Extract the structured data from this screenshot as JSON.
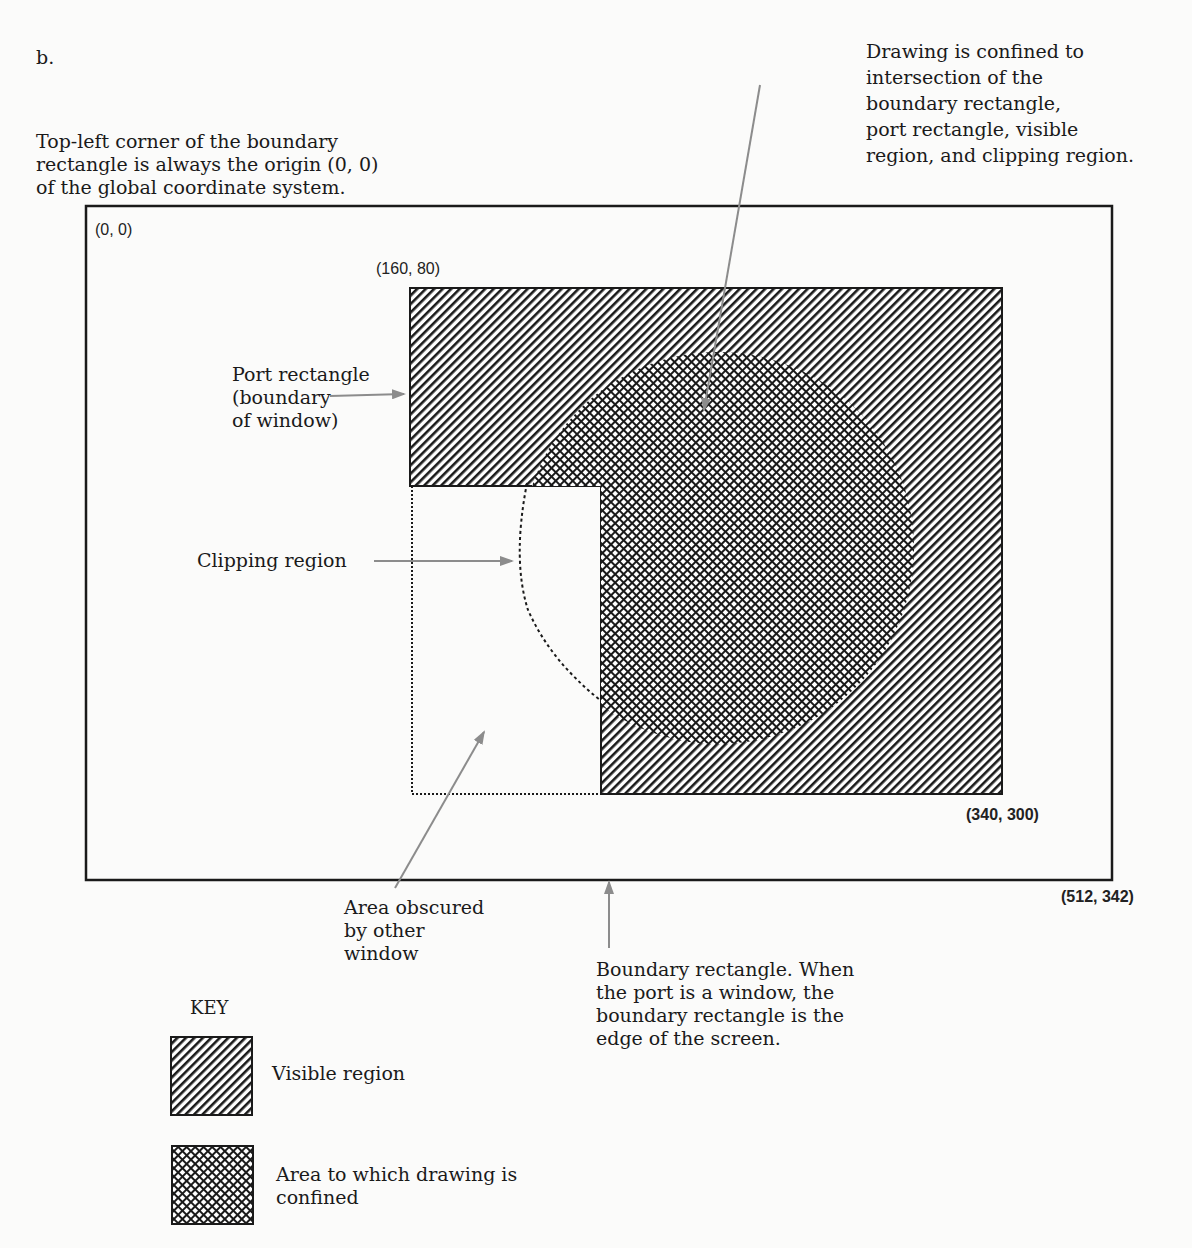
{
  "figure": {
    "label": "b.",
    "annotations": {
      "origin_note": "Top-left corner of the boundary\nrectangle is always the origin (0, 0)\nof the global coordinate system.",
      "drawing_confined": "Drawing is confined to\nintersection of the\nboundary rectangle,\nport rectangle, visible\nregion, and clipping region.",
      "port_rectangle": "Port rectangle\n(boundary\nof window)",
      "clipping_region": "Clipping region",
      "area_obscured": "Area obscured\nby other\nwindow",
      "boundary_rectangle": "Boundary rectangle. When\nthe port is a window, the\nboundary rectangle is the\nedge of the screen."
    },
    "coordinates": {
      "boundary_top_left": "(0, 0)",
      "port_top_left": "(160, 80)",
      "port_bottom_right": "(340, 300)",
      "boundary_bottom_right": "(512, 342)"
    },
    "key": {
      "title": "KEY",
      "items": [
        {
          "pattern": "diagonal-hatch",
          "label": "Visible region"
        },
        {
          "pattern": "cross-hatch",
          "label": "Area to which drawing is\nconfined"
        }
      ]
    },
    "colors": {
      "ink": "#1a1a1a",
      "arrow": "#8c8c8c",
      "paper": "#fbfbfa"
    }
  }
}
